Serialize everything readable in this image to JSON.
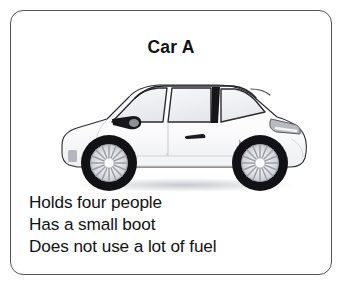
{
  "card": {
    "title": "Car A",
    "border_color": "#555558",
    "background_color": "#ffffff",
    "text_color": "#121215"
  },
  "illustration": {
    "name": "car-side-profile",
    "description": "White three-door hatchback shown in side profile facing left",
    "body_color": "#fdfdfd",
    "glass_color": "#f2f3f5",
    "outline_color": "#23232a",
    "tire_color": "#121216",
    "rim_color": "#e8e9ec",
    "accent_shadow_color": "#a9abb0",
    "pillar_color": "#15151a",
    "mirror_color": "#16161b"
  },
  "description": {
    "lines": [
      "Holds four people",
      "Has a small boot",
      "Does not use a lot of fuel"
    ]
  }
}
